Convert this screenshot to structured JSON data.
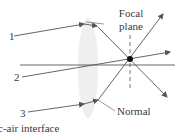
{
  "diagram": {
    "type": "thin lens ray diagram",
    "colors": {
      "line": "#555555",
      "lens": "#eeeeee",
      "focal_point": "#111111"
    },
    "rays": [
      {
        "label": "1"
      },
      {
        "label": "2"
      },
      {
        "label": "3"
      }
    ],
    "focal_plane_label_line1": "Focal",
    "focal_plane_label_line2": "plane",
    "normal_label": "Normal",
    "interface_label": "c-air interface"
  }
}
